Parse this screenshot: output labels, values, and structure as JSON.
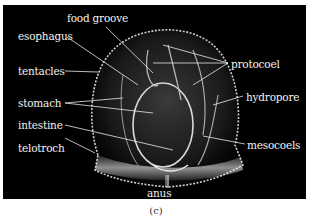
{
  "figure": {
    "caption": "(c)",
    "background": "#000000",
    "label_color": "#f2f2f2"
  },
  "labels": {
    "food_groove": "food groove",
    "esophagus": "esophagus",
    "tentacles": "tentacles",
    "stomach": "stomach",
    "intestine": "intestine",
    "telotroch": "telotroch",
    "anus": "anus",
    "protocoel": "protocoel",
    "hydropore": "hydropore",
    "mesocoels": "mesocoels"
  }
}
